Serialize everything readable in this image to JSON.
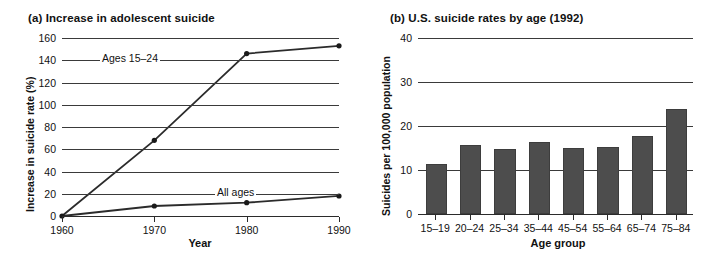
{
  "chart_data": [
    {
      "type": "line",
      "panel": "(a)",
      "title": "(a) Increase in adolescent suicide",
      "xlabel": "Year",
      "ylabel": "Increase in suicide rate (%)",
      "x": [
        1960,
        1970,
        1980,
        1990
      ],
      "xticklabels": [
        "1960",
        "1970",
        "1980",
        "1990"
      ],
      "yticks": [
        0,
        20,
        40,
        60,
        80,
        100,
        120,
        140,
        160
      ],
      "yticklabels": [
        "0",
        "20",
        "40",
        "60",
        "80",
        "100",
        "120",
        "140",
        "160"
      ],
      "ylim": [
        0,
        160
      ],
      "grid": true,
      "legend_position": "inline-annotations",
      "series": [
        {
          "name": "Ages 15–24",
          "values": [
            0,
            68,
            146,
            153
          ]
        },
        {
          "name": "All ages",
          "values": [
            0,
            9,
            12,
            18
          ]
        }
      ],
      "annotations": [
        {
          "text": "Ages 15–24"
        },
        {
          "text": "All ages"
        }
      ]
    },
    {
      "type": "bar",
      "panel": "(b)",
      "title": "(b) U.S. suicide rates by age (1992)",
      "xlabel": "Age group",
      "ylabel": "Suicides per 100,000 population",
      "categories": [
        "15–19",
        "20–24",
        "25–34",
        "35–44",
        "45–54",
        "55–64",
        "65–74",
        "75–84"
      ],
      "values": [
        10.9,
        15.3,
        14.3,
        15.8,
        14.6,
        14.8,
        17.2,
        23.5
      ],
      "yticks": [
        0,
        10,
        20,
        30,
        40
      ],
      "yticklabels": [
        "0",
        "10",
        "20",
        "30",
        "40"
      ],
      "ylim": [
        0,
        40
      ],
      "grid": true,
      "bar_color": "#4d4d4d"
    }
  ],
  "figure": {
    "background": "#ffffff",
    "ink_color": "#1a1a1a"
  }
}
